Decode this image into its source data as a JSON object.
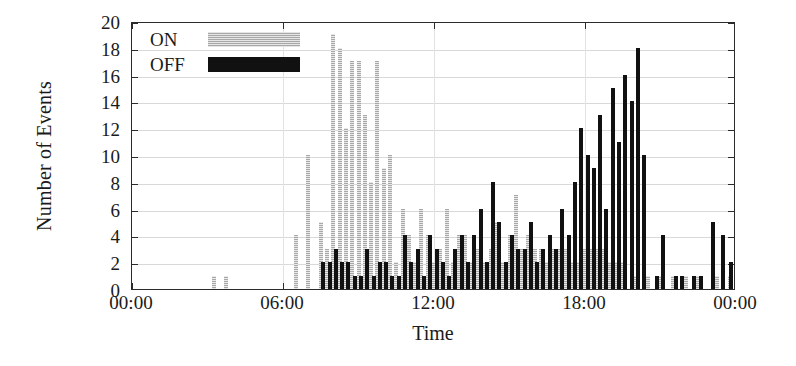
{
  "chart_data": {
    "type": "bar",
    "title": "",
    "xlabel": "Time",
    "ylabel": "Number of Events",
    "xlim": [
      "00:00",
      "24:00"
    ],
    "ylim": [
      0,
      20
    ],
    "ytick_labels": [
      "0",
      "2",
      "4",
      "6",
      "8",
      "10",
      "12",
      "14",
      "16",
      "18",
      "20"
    ],
    "ytick_values": [
      0,
      2,
      4,
      6,
      8,
      10,
      12,
      14,
      16,
      18,
      20
    ],
    "xtick_labels": [
      "00:00",
      "06:00",
      "12:00",
      "18:00",
      "00:00"
    ],
    "xtick_values": [
      0,
      6,
      12,
      18,
      24
    ],
    "grid": "horizontal-and-vertical",
    "legend_position": "top-left-inside",
    "bar_interval_minutes": 15,
    "colors": {
      "on": "#a8a8a8",
      "off": "#111111",
      "axis": "#2b2b2b",
      "grid": "#d9d9d9",
      "background": "#ffffff"
    },
    "series": [
      {
        "name": "ON",
        "color": "#a8a8a8",
        "pattern": "dotted-hatch",
        "points": [
          {
            "t": 3.25,
            "v": 1
          },
          {
            "t": 3.75,
            "v": 1
          },
          {
            "t": 6.5,
            "v": 4
          },
          {
            "t": 7.0,
            "v": 10
          },
          {
            "t": 7.5,
            "v": 5
          },
          {
            "t": 7.75,
            "v": 3
          },
          {
            "t": 8.0,
            "v": 19
          },
          {
            "t": 8.25,
            "v": 18
          },
          {
            "t": 8.5,
            "v": 12
          },
          {
            "t": 8.75,
            "v": 17
          },
          {
            "t": 9.0,
            "v": 17
          },
          {
            "t": 9.25,
            "v": 13
          },
          {
            "t": 9.5,
            "v": 8
          },
          {
            "t": 9.75,
            "v": 17
          },
          {
            "t": 10.0,
            "v": 9
          },
          {
            "t": 10.25,
            "v": 10
          },
          {
            "t": 10.5,
            "v": 2
          },
          {
            "t": 10.75,
            "v": 6
          },
          {
            "t": 11.0,
            "v": 4
          },
          {
            "t": 11.25,
            "v": 2
          },
          {
            "t": 11.5,
            "v": 6
          },
          {
            "t": 11.75,
            "v": 4
          },
          {
            "t": 12.0,
            "v": 2
          },
          {
            "t": 12.25,
            "v": 3
          },
          {
            "t": 12.5,
            "v": 6
          },
          {
            "t": 12.75,
            "v": 2
          },
          {
            "t": 13.0,
            "v": 4
          },
          {
            "t": 13.25,
            "v": 4
          },
          {
            "t": 13.5,
            "v": 2
          },
          {
            "t": 13.75,
            "v": 3
          },
          {
            "t": 14.0,
            "v": 2
          },
          {
            "t": 14.25,
            "v": 3
          },
          {
            "t": 14.5,
            "v": 5
          },
          {
            "t": 14.75,
            "v": 2
          },
          {
            "t": 15.0,
            "v": 4
          },
          {
            "t": 15.25,
            "v": 7
          },
          {
            "t": 15.5,
            "v": 3
          },
          {
            "t": 15.75,
            "v": 4
          },
          {
            "t": 16.0,
            "v": 3
          },
          {
            "t": 16.25,
            "v": 3
          },
          {
            "t": 16.5,
            "v": 2
          },
          {
            "t": 16.75,
            "v": 3
          },
          {
            "t": 17.0,
            "v": 3
          },
          {
            "t": 17.25,
            "v": 3
          },
          {
            "t": 17.5,
            "v": 2
          },
          {
            "t": 17.75,
            "v": 2
          },
          {
            "t": 18.0,
            "v": 3
          },
          {
            "t": 18.25,
            "v": 3
          },
          {
            "t": 18.5,
            "v": 3
          },
          {
            "t": 18.75,
            "v": 3
          },
          {
            "t": 19.0,
            "v": 2
          },
          {
            "t": 19.25,
            "v": 2
          },
          {
            "t": 19.5,
            "v": 2
          },
          {
            "t": 20.0,
            "v": 1
          },
          {
            "t": 20.5,
            "v": 1
          },
          {
            "t": 21.0,
            "v": 1
          },
          {
            "t": 21.5,
            "v": 1
          },
          {
            "t": 22.0,
            "v": 1
          },
          {
            "t": 22.5,
            "v": 1
          },
          {
            "t": 23.25,
            "v": 1
          },
          {
            "t": 23.75,
            "v": 1
          }
        ]
      },
      {
        "name": "OFF",
        "color": "#111111",
        "pattern": "solid",
        "points": [
          {
            "t": 7.6,
            "v": 2
          },
          {
            "t": 7.85,
            "v": 2
          },
          {
            "t": 8.1,
            "v": 3
          },
          {
            "t": 8.35,
            "v": 2
          },
          {
            "t": 8.6,
            "v": 2
          },
          {
            "t": 8.85,
            "v": 1
          },
          {
            "t": 9.1,
            "v": 1
          },
          {
            "t": 9.35,
            "v": 3
          },
          {
            "t": 9.6,
            "v": 1
          },
          {
            "t": 9.85,
            "v": 2
          },
          {
            "t": 10.1,
            "v": 2
          },
          {
            "t": 10.35,
            "v": 1
          },
          {
            "t": 10.6,
            "v": 1
          },
          {
            "t": 10.85,
            "v": 4
          },
          {
            "t": 11.1,
            "v": 2
          },
          {
            "t": 11.35,
            "v": 3
          },
          {
            "t": 11.6,
            "v": 1
          },
          {
            "t": 11.85,
            "v": 4
          },
          {
            "t": 12.1,
            "v": 3
          },
          {
            "t": 12.35,
            "v": 2
          },
          {
            "t": 12.6,
            "v": 1
          },
          {
            "t": 12.85,
            "v": 3
          },
          {
            "t": 13.1,
            "v": 4
          },
          {
            "t": 13.35,
            "v": 2
          },
          {
            "t": 13.6,
            "v": 4
          },
          {
            "t": 13.85,
            "v": 6
          },
          {
            "t": 14.1,
            "v": 2
          },
          {
            "t": 14.35,
            "v": 8
          },
          {
            "t": 14.6,
            "v": 5
          },
          {
            "t": 14.85,
            "v": 2
          },
          {
            "t": 15.1,
            "v": 4
          },
          {
            "t": 15.35,
            "v": 3
          },
          {
            "t": 15.6,
            "v": 3
          },
          {
            "t": 15.85,
            "v": 5
          },
          {
            "t": 16.1,
            "v": 2
          },
          {
            "t": 16.35,
            "v": 3
          },
          {
            "t": 16.6,
            "v": 4
          },
          {
            "t": 16.85,
            "v": 3
          },
          {
            "t": 17.1,
            "v": 6
          },
          {
            "t": 17.35,
            "v": 4
          },
          {
            "t": 17.6,
            "v": 8
          },
          {
            "t": 17.85,
            "v": 12
          },
          {
            "t": 18.1,
            "v": 10
          },
          {
            "t": 18.35,
            "v": 9
          },
          {
            "t": 18.6,
            "v": 13
          },
          {
            "t": 18.85,
            "v": 6
          },
          {
            "t": 19.1,
            "v": 15
          },
          {
            "t": 19.35,
            "v": 11
          },
          {
            "t": 19.6,
            "v": 16
          },
          {
            "t": 19.85,
            "v": 14
          },
          {
            "t": 20.1,
            "v": 18
          },
          {
            "t": 20.35,
            "v": 10
          },
          {
            "t": 20.85,
            "v": 1
          },
          {
            "t": 21.1,
            "v": 4
          },
          {
            "t": 21.6,
            "v": 1
          },
          {
            "t": 21.85,
            "v": 1
          },
          {
            "t": 22.35,
            "v": 1
          },
          {
            "t": 22.6,
            "v": 1
          },
          {
            "t": 23.1,
            "v": 5
          },
          {
            "t": 23.5,
            "v": 4
          },
          {
            "t": 23.8,
            "v": 2
          }
        ]
      }
    ]
  },
  "legend": {
    "items": [
      {
        "label": "ON",
        "key": "on"
      },
      {
        "label": "OFF",
        "key": "off"
      }
    ]
  }
}
